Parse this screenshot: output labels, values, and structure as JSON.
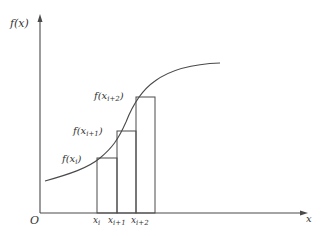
{
  "axes": {
    "y_label": "f(x)",
    "x_label": "x",
    "origin_label": "O",
    "color": "#4a4a4a"
  },
  "curve": {
    "color": "#4a4a4a",
    "description": "increasing S-shaped curve"
  },
  "function_labels": [
    {
      "f": "f(",
      "var": "x",
      "sub": "i",
      "close": ")"
    },
    {
      "f": "f(",
      "var": "x",
      "sub": "i+1",
      "close": ")"
    },
    {
      "f": "f(",
      "var": "x",
      "sub": "i+2",
      "close": ")"
    }
  ],
  "tick_labels": [
    {
      "var": "x",
      "sub": "i"
    },
    {
      "var": "x",
      "sub": "i+1"
    },
    {
      "var": "x",
      "sub": "i+2"
    }
  ],
  "rectangles": {
    "count": 3,
    "color": "#4a4a4a"
  }
}
